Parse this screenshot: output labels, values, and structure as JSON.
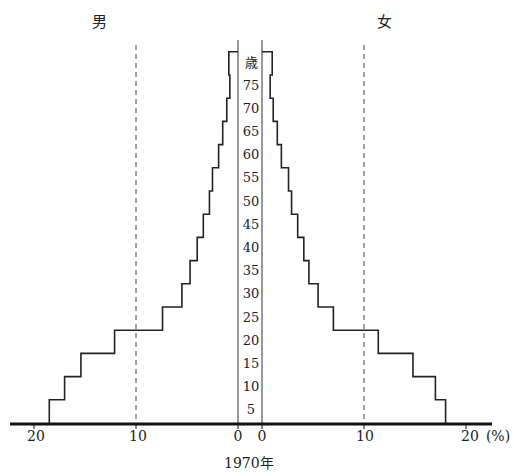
{
  "chart_data": {
    "type": "bar",
    "subtype": "population-pyramid",
    "title": "1970年",
    "xlabel": "(%)",
    "ylabel": "歳",
    "left_label": "男",
    "right_label": "女",
    "xlim": [
      0,
      20
    ],
    "x_ticks_left": [
      "20",
      "10",
      "0"
    ],
    "x_ticks_right": [
      "0",
      "10",
      "20"
    ],
    "x_unit": "(%)",
    "age_ticks": [
      "5",
      "10",
      "15",
      "20",
      "25",
      "30",
      "35",
      "40",
      "45",
      "50",
      "55",
      "60",
      "65",
      "70",
      "75"
    ],
    "age_unit": "歳",
    "categories": [
      "0-4",
      "5-9",
      "10-14",
      "15-19",
      "20-24",
      "25-29",
      "30-34",
      "35-39",
      "40-44",
      "45-49",
      "50-54",
      "55-59",
      "60-64",
      "65-69",
      "70-74",
      "75-79"
    ],
    "series": [
      {
        "name": "男",
        "values": [
          18.5,
          17.0,
          15.4,
          12.1,
          7.4,
          5.5,
          4.7,
          4.0,
          3.4,
          2.8,
          2.5,
          1.9,
          1.5,
          1.1,
          0.8,
          0.9
        ]
      },
      {
        "name": "女",
        "values": [
          18.0,
          17.0,
          14.8,
          11.4,
          7.0,
          5.5,
          4.6,
          4.1,
          3.5,
          2.9,
          2.6,
          1.9,
          1.5,
          1.1,
          0.8,
          1.0
        ]
      }
    ],
    "gridlines": [
      10
    ],
    "grid_style": "dashed"
  }
}
